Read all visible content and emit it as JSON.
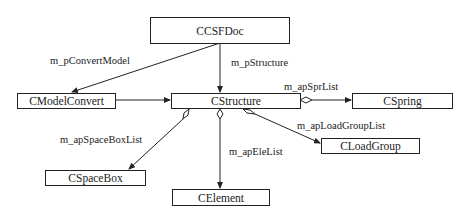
{
  "diagram": {
    "type": "UML class diagram",
    "classes": {
      "ccsfdoc": "CCSFDoc",
      "cmodelconvert": "CModelConvert",
      "cstructure": "CStructure",
      "cspring": "CSpring",
      "cloadgroup": "CLoadGroup",
      "cspacebox": "CSpaceBox",
      "celement": "CElement"
    },
    "relations": [
      {
        "from": "CCSFDoc",
        "to": "CModelConvert",
        "label": "m_pConvertModel",
        "kind": "association"
      },
      {
        "from": "CCSFDoc",
        "to": "CStructure",
        "label": "m_pStructure",
        "kind": "association"
      },
      {
        "from": "CModelConvert",
        "to": "CStructure",
        "label": "",
        "kind": "association"
      },
      {
        "from": "CStructure",
        "to": "CSpring",
        "label": "m_apSprList",
        "kind": "aggregation"
      },
      {
        "from": "CStructure",
        "to": "CLoadGroup",
        "label": "m_apLoadGroupList",
        "kind": "aggregation"
      },
      {
        "from": "CStructure",
        "to": "CSpaceBox",
        "label": "m_apSpaceBoxList",
        "kind": "aggregation"
      },
      {
        "from": "CStructure",
        "to": "CElement",
        "label": "m_apEleList",
        "kind": "aggregation"
      }
    ],
    "labels": {
      "convert_model": "m_pConvertModel",
      "structure": "m_pStructure",
      "spr_list": "m_apSprList",
      "load_group_list": "m_apLoadGroupList",
      "space_box_list": "m_apSpaceBoxList",
      "ele_list": "m_apEleList"
    },
    "colors": {
      "line": "#222222",
      "background": "#ffffff"
    }
  }
}
